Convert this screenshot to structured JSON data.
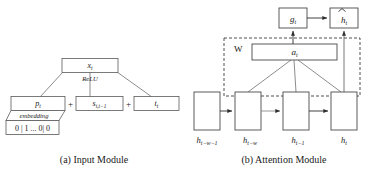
{
  "figure": {
    "background": "#ffffff",
    "stroke": "#4a4a4a",
    "dashed_stroke": "#3c3c3c"
  },
  "panel_a": {
    "caption": "(a) Input Module",
    "output_box": {
      "label": "x",
      "sub": "t"
    },
    "activation_label": "ReLU",
    "operators": {
      "plus1": "+",
      "plus2": "+"
    },
    "term_boxes": [
      {
        "label": "p",
        "sub": "t"
      },
      {
        "label": "s",
        "sub": "t,t−1"
      },
      {
        "label": "t",
        "sub": "t"
      }
    ],
    "embedding_label": "embedding",
    "onehot_vector": "0 | 1 ... 0| 0"
  },
  "panel_b": {
    "caption": "(b) Attention Module",
    "gate_box": {
      "label": "g",
      "sub": "t"
    },
    "output_box": {
      "label": "h",
      "sub": "t",
      "hat": true
    },
    "attention_box": {
      "label": "a",
      "sub": "t"
    },
    "weight_label": "W",
    "hidden_states": [
      {
        "label": "h",
        "sub": "t−w−1"
      },
      {
        "label": "h",
        "sub": "t−w"
      },
      {
        "label": "h",
        "sub": "t−1"
      },
      {
        "label": "h",
        "sub": "t"
      }
    ]
  }
}
